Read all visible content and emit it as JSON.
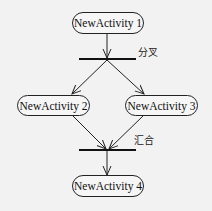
{
  "diagram": {
    "type": "uml-activity",
    "nodes": [
      {
        "id": "a1",
        "label": "NewActivity 1"
      },
      {
        "id": "a2",
        "label": "NewActivity 2"
      },
      {
        "id": "a3",
        "label": "NewActivity 3"
      },
      {
        "id": "a4",
        "label": "NewActivity 4"
      }
    ],
    "bars": [
      {
        "id": "fork",
        "label": "分叉"
      },
      {
        "id": "join",
        "label": "汇合"
      }
    ],
    "edges": [
      {
        "from": "a1",
        "to": "fork"
      },
      {
        "from": "fork",
        "to": "a2"
      },
      {
        "from": "fork",
        "to": "a3"
      },
      {
        "from": "a2",
        "to": "join"
      },
      {
        "from": "a3",
        "to": "join"
      },
      {
        "from": "join",
        "to": "a4"
      }
    ],
    "colors": {
      "background": "#f2f2f2",
      "stroke": "#222222",
      "bar": "#111111"
    }
  }
}
